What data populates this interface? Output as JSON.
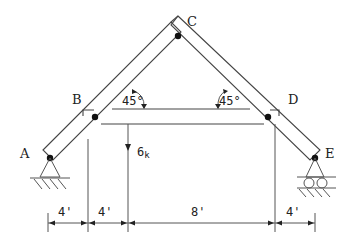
{
  "figure": {
    "type": "frame-structure",
    "joints": {
      "A": {
        "label": "A",
        "support": "pin"
      },
      "B": {
        "label": "B"
      },
      "C": {
        "label": "C"
      },
      "D": {
        "label": "D"
      },
      "E": {
        "label": "E",
        "support": "roller"
      }
    },
    "angles": [
      {
        "label": "45°",
        "at": "B"
      },
      {
        "label": "45°",
        "at": "D"
      }
    ],
    "load": {
      "value": "6",
      "unit": "k",
      "direction": "down"
    },
    "dimensions": [
      {
        "label": "4'"
      },
      {
        "label": "4'"
      },
      {
        "label": "8'"
      },
      {
        "label": "4'"
      }
    ]
  }
}
